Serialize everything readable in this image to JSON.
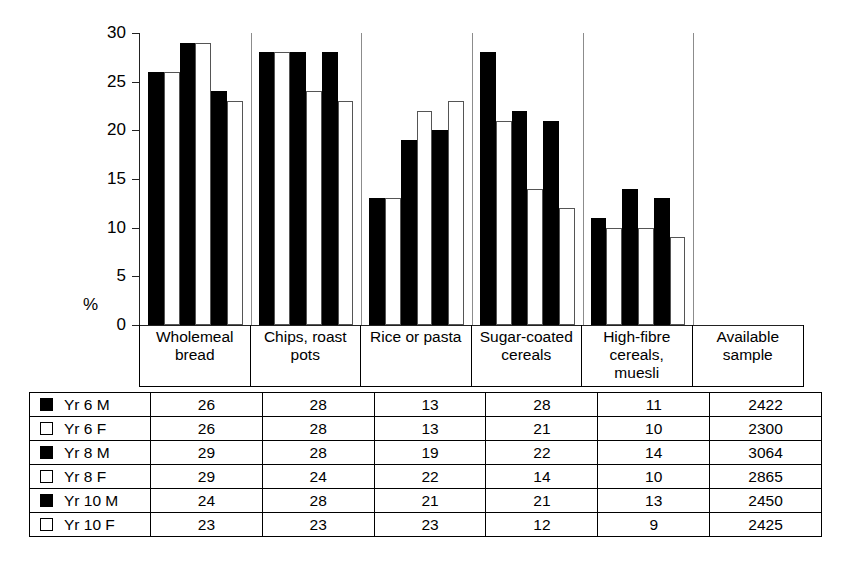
{
  "chart_data": {
    "type": "bar",
    "title": "",
    "xlabel": "",
    "ylabel": "%",
    "ylim": [
      0,
      30
    ],
    "yticks": [
      30,
      25,
      20,
      15,
      10,
      5,
      0
    ],
    "grid": false,
    "legend_position": "table-below",
    "categories": [
      "Wholemeal bread",
      "Chips, roast pots",
      "Rice or pasta",
      "Sugar-coated cereals",
      "High-fibre cereals, muesli"
    ],
    "series": [
      {
        "name": "Yr 6 M",
        "fill": "filled",
        "values": [
          26,
          28,
          13,
          28,
          11
        ]
      },
      {
        "name": "Yr 6 F",
        "fill": "open",
        "values": [
          26,
          28,
          13,
          21,
          10
        ]
      },
      {
        "name": "Yr 8 M",
        "fill": "filled",
        "values": [
          29,
          28,
          19,
          22,
          14
        ]
      },
      {
        "name": "Yr 8 F",
        "fill": "open",
        "values": [
          29,
          24,
          22,
          14,
          10
        ]
      },
      {
        "name": "Yr 10 M",
        "fill": "filled",
        "values": [
          24,
          28,
          20,
          21,
          13
        ]
      },
      {
        "name": "Yr 10 F",
        "fill": "open",
        "values": [
          23,
          23,
          23,
          12,
          9
        ]
      }
    ]
  },
  "axis": {
    "y_title": "%",
    "tick_labels": [
      "30",
      "25",
      "20",
      "15",
      "10",
      "5",
      "0"
    ]
  },
  "header": {
    "columns": [
      {
        "lines": [
          "Wholemeal",
          "bread"
        ]
      },
      {
        "lines": [
          "Chips, roast",
          "pots"
        ]
      },
      {
        "lines": [
          "Rice or pasta"
        ]
      },
      {
        "lines": [
          "Sugar-coated",
          "cereals"
        ]
      },
      {
        "lines": [
          "High-fibre",
          "cereals,",
          "muesli"
        ]
      },
      {
        "lines": [
          "Available",
          "sample"
        ]
      }
    ]
  },
  "table": {
    "rows": [
      {
        "swatch": "filled",
        "label": "Yr 6 M",
        "cells": [
          "26",
          "28",
          "13",
          "28",
          "11",
          "2422"
        ]
      },
      {
        "swatch": "open",
        "label": "Yr 6 F",
        "cells": [
          "26",
          "28",
          "13",
          "21",
          "10",
          "2300"
        ]
      },
      {
        "swatch": "filled",
        "label": "Yr 8 M",
        "cells": [
          "29",
          "28",
          "19",
          "22",
          "14",
          "3064"
        ]
      },
      {
        "swatch": "open",
        "label": "Yr 8 F",
        "cells": [
          "29",
          "24",
          "22",
          "14",
          "10",
          "2865"
        ]
      },
      {
        "swatch": "filled",
        "label": "Yr 10 M",
        "cells": [
          "24",
          "28",
          "21",
          "21",
          "13",
          "2450"
        ]
      },
      {
        "swatch": "open",
        "label": "Yr 10 F",
        "cells": [
          "23",
          "23",
          "23",
          "12",
          "9",
          "2425"
        ]
      }
    ]
  },
  "colors": {
    "filled_bar": "#000000",
    "open_bar": "#ffffff",
    "outline": "#000000",
    "background": "#ffffff"
  }
}
